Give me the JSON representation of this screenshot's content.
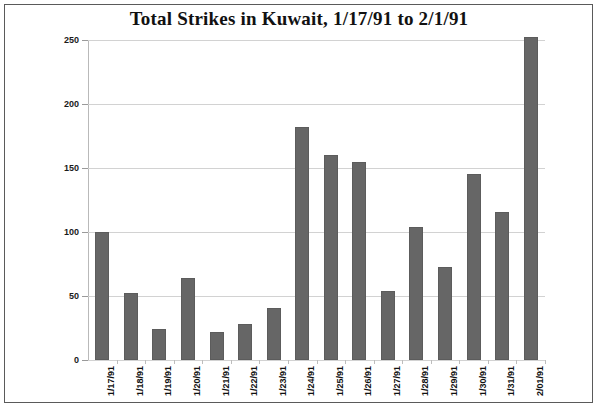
{
  "chart_data": {
    "type": "bar",
    "title": "Total Strikes in Kuwait, 1/17/91 to 2/1/91",
    "xlabel": "",
    "ylabel": "",
    "categories": [
      "1/17/91",
      "1/18/91",
      "1/19/91",
      "1/20/91",
      "1/21/91",
      "1/22/91",
      "1/23/91",
      "1/24/91",
      "1/25/91",
      "1/26/91",
      "1/27/91",
      "1/28/91",
      "1/29/91",
      "1/30/91",
      "1/31/91",
      "2/01/91"
    ],
    "values": [
      100,
      52,
      24,
      64,
      22,
      28,
      41,
      182,
      160,
      155,
      54,
      104,
      73,
      145,
      116,
      252
    ],
    "ylim": [
      0,
      250
    ],
    "yticks": [
      0,
      50,
      100,
      150,
      200,
      250
    ],
    "ytick_labels": [
      "0",
      "50",
      "100",
      "150",
      "200",
      "250"
    ],
    "grid": true,
    "legend": false,
    "bar_color": "#666666",
    "grid_color": "#d2d2d2",
    "axis_color": "#b9b9b9",
    "frame_color": "#5a5a5a",
    "background": "#ffffff"
  }
}
